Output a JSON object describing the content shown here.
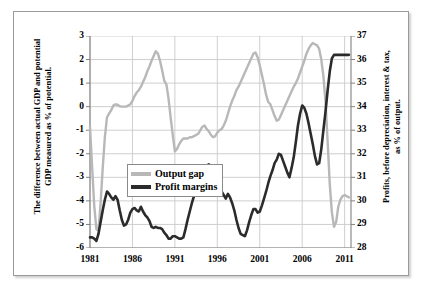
{
  "chart_data": {
    "type": "line",
    "title": "",
    "xlabel": "",
    "ylabel": "The difference between actual GDP and potential GDP measured as % of potential.",
    "ylabel_right": "Profits, before depreciation, interest & tax, as % of output.",
    "grid": true,
    "legend_position": "inside-left-middle",
    "xlim": [
      1981,
      2011.75
    ],
    "xticks": [
      "1981",
      "1986",
      "1991",
      "1996",
      "2001",
      "2006",
      "2011"
    ],
    "xtick_values": [
      1981,
      1986,
      1991,
      1996,
      2001,
      2006,
      2011
    ],
    "ylim": [
      -6,
      3
    ],
    "yticks": [
      "3",
      "2",
      "1",
      "0",
      "-1",
      "-2",
      "-3",
      "-4",
      "-5",
      "-6"
    ],
    "ytick_values": [
      3,
      2,
      1,
      0,
      -1,
      -2,
      -3,
      -4,
      -5,
      -6
    ],
    "ylim_right": [
      28,
      37
    ],
    "yticks_right": [
      "37",
      "36",
      "35",
      "34",
      "33",
      "32",
      "31",
      "30",
      "29",
      "28"
    ],
    "ytick_values_right": [
      37,
      36,
      35,
      34,
      33,
      32,
      31,
      30,
      29,
      28
    ],
    "colors": {
      "output_gap": "#b8b8b8",
      "profit_margins": "#2b2b2b",
      "grid": "#c9c9c9",
      "axis": "#808080"
    },
    "series": [
      {
        "name": "Output gap",
        "axis": "left",
        "color": "#b8b8b8",
        "x": [
          1981.0,
          1981.25,
          1981.5,
          1981.75,
          1982.0,
          1982.25,
          1982.5,
          1982.75,
          1983.0,
          1983.25,
          1983.5,
          1983.75,
          1984.0,
          1984.25,
          1984.5,
          1984.75,
          1985.0,
          1985.25,
          1985.5,
          1985.75,
          1986.0,
          1986.25,
          1986.5,
          1986.75,
          1987.0,
          1987.25,
          1987.5,
          1987.75,
          1988.0,
          1988.25,
          1988.5,
          1988.75,
          1989.0,
          1989.25,
          1989.5,
          1989.75,
          1990.0,
          1990.25,
          1990.5,
          1990.75,
          1991.0,
          1991.25,
          1991.5,
          1991.75,
          1992.0,
          1992.25,
          1992.5,
          1992.75,
          1993.0,
          1993.25,
          1993.5,
          1993.75,
          1994.0,
          1994.25,
          1994.5,
          1994.75,
          1995.0,
          1995.25,
          1995.5,
          1995.75,
          1996.0,
          1996.25,
          1996.5,
          1996.75,
          1997.0,
          1997.25,
          1997.5,
          1997.75,
          1998.0,
          1998.25,
          1998.5,
          1998.75,
          1999.0,
          1999.25,
          1999.5,
          1999.75,
          2000.0,
          2000.25,
          2000.5,
          2000.75,
          2001.0,
          2001.25,
          2001.5,
          2001.75,
          2002.0,
          2002.25,
          2002.5,
          2002.75,
          2003.0,
          2003.25,
          2003.5,
          2003.75,
          2004.0,
          2004.25,
          2004.5,
          2004.75,
          2005.0,
          2005.25,
          2005.5,
          2005.75,
          2006.0,
          2006.25,
          2006.5,
          2006.75,
          2007.0,
          2007.25,
          2007.5,
          2007.75,
          2008.0,
          2008.25,
          2008.5,
          2008.75,
          2009.0,
          2009.25,
          2009.5,
          2009.75,
          2010.0,
          2010.25,
          2010.5,
          2010.75,
          2011.0,
          2011.25,
          2011.5
        ],
        "values": [
          -0.85,
          -2.55,
          -4.2,
          -5.2,
          -5.25,
          -4.1,
          -2.6,
          -1.3,
          -0.45,
          -0.3,
          -0.15,
          0.05,
          0.1,
          0.08,
          0.02,
          0.0,
          0.0,
          0.0,
          0.05,
          0.1,
          0.25,
          0.45,
          0.6,
          0.7,
          0.85,
          1.05,
          1.25,
          1.5,
          1.7,
          1.95,
          2.15,
          2.35,
          2.25,
          1.95,
          1.55,
          1.1,
          0.95,
          0.35,
          -0.45,
          -1.2,
          -1.9,
          -1.8,
          -1.6,
          -1.45,
          -1.35,
          -1.35,
          -1.35,
          -1.3,
          -1.3,
          -1.25,
          -1.2,
          -1.15,
          -1.0,
          -0.85,
          -0.8,
          -0.95,
          -1.05,
          -1.2,
          -1.3,
          -1.25,
          -1.1,
          -1.0,
          -0.95,
          -0.8,
          -0.6,
          -0.3,
          0.0,
          0.25,
          0.45,
          0.7,
          0.85,
          1.05,
          1.25,
          1.45,
          1.65,
          1.85,
          2.05,
          2.25,
          2.3,
          2.1,
          1.75,
          1.35,
          0.95,
          0.5,
          0.2,
          0.1,
          -0.15,
          -0.4,
          -0.6,
          -0.55,
          -0.35,
          -0.15,
          0.05,
          0.25,
          0.45,
          0.65,
          0.85,
          1.0,
          1.2,
          1.45,
          1.7,
          1.95,
          2.25,
          2.45,
          2.6,
          2.7,
          2.65,
          2.6,
          2.45,
          2.0,
          1.3,
          0.2,
          -1.5,
          -3.3,
          -4.5,
          -5.1,
          -4.9,
          -4.25,
          -3.95,
          -3.8,
          -3.75,
          -3.8,
          -3.85
        ]
      },
      {
        "name": "Profit margins",
        "axis": "right",
        "color": "#2b2b2b",
        "x": [
          1981.0,
          1981.25,
          1981.5,
          1981.75,
          1982.0,
          1982.25,
          1982.5,
          1982.75,
          1983.0,
          1983.25,
          1983.5,
          1983.75,
          1984.0,
          1984.25,
          1984.5,
          1984.75,
          1985.0,
          1985.25,
          1985.5,
          1985.75,
          1986.0,
          1986.25,
          1986.5,
          1986.75,
          1987.0,
          1987.25,
          1987.5,
          1987.75,
          1988.0,
          1988.25,
          1988.5,
          1988.75,
          1989.0,
          1989.25,
          1989.5,
          1989.75,
          1990.0,
          1990.25,
          1990.5,
          1990.75,
          1991.0,
          1991.25,
          1991.5,
          1991.75,
          1992.0,
          1992.25,
          1992.5,
          1992.75,
          1993.0,
          1993.25,
          1993.5,
          1993.75,
          1994.0,
          1994.25,
          1994.5,
          1994.75,
          1995.0,
          1995.25,
          1995.5,
          1995.75,
          1996.0,
          1996.25,
          1996.5,
          1996.75,
          1997.0,
          1997.25,
          1997.5,
          1997.75,
          1998.0,
          1998.25,
          1998.5,
          1998.75,
          1999.0,
          1999.25,
          1999.5,
          1999.75,
          2000.0,
          2000.25,
          2000.5,
          2000.75,
          2001.0,
          2001.25,
          2001.5,
          2001.75,
          2002.0,
          2002.25,
          2002.5,
          2002.75,
          2003.0,
          2003.25,
          2003.5,
          2003.75,
          2004.0,
          2004.25,
          2004.5,
          2004.75,
          2005.0,
          2005.25,
          2005.5,
          2005.75,
          2006.0,
          2006.25,
          2006.5,
          2006.75,
          2007.0,
          2007.25,
          2007.5,
          2007.75,
          2008.0,
          2008.25,
          2008.5,
          2008.75,
          2009.0,
          2009.25,
          2009.5,
          2009.75,
          2010.0,
          2010.25,
          2010.5,
          2010.75,
          2011.0,
          2011.25,
          2011.5
        ],
        "values": [
          28.45,
          28.45,
          28.4,
          28.3,
          28.6,
          29.1,
          29.6,
          30.05,
          30.4,
          30.3,
          30.15,
          30.05,
          30.2,
          30.05,
          29.6,
          29.2,
          28.95,
          29.0,
          29.2,
          29.5,
          29.65,
          29.7,
          29.6,
          29.55,
          29.75,
          29.55,
          29.4,
          29.3,
          29.15,
          28.9,
          28.85,
          28.9,
          28.85,
          28.85,
          28.8,
          28.65,
          28.55,
          28.4,
          28.4,
          28.5,
          28.5,
          28.45,
          28.4,
          28.4,
          28.45,
          28.8,
          29.2,
          29.55,
          29.9,
          30.2,
          30.5,
          30.75,
          30.95,
          31.05,
          31.25,
          31.5,
          31.55,
          31.45,
          31.3,
          31.0,
          30.7,
          30.45,
          30.4,
          30.25,
          30.1,
          30.3,
          30.15,
          29.9,
          29.6,
          29.2,
          28.85,
          28.6,
          28.55,
          28.5,
          28.75,
          29.1,
          29.4,
          29.65,
          29.65,
          29.5,
          29.55,
          29.8,
          30.1,
          30.4,
          30.75,
          31.05,
          31.3,
          31.6,
          31.75,
          32.0,
          31.95,
          31.7,
          31.45,
          31.2,
          31.0,
          31.4,
          31.85,
          32.5,
          33.2,
          33.7,
          34.05,
          33.95,
          33.7,
          33.3,
          32.85,
          32.4,
          31.9,
          31.55,
          31.6,
          32.2,
          33.0,
          33.8,
          34.7,
          35.5,
          36.05,
          36.2,
          36.2,
          36.2,
          36.2,
          36.2,
          36.2,
          36.2,
          36.2
        ]
      }
    ]
  },
  "axis_titles": {
    "left_line1": "The difference between actual GDP and potential",
    "left_line2": "GDP measured as % of potential.",
    "right_line1": "Profits, before depreciation, interest & tax,",
    "right_line2": "as % of output."
  },
  "legend": {
    "items": [
      {
        "label": "Output gap",
        "color": "#b8b8b8"
      },
      {
        "label": "Profit margins",
        "color": "#2b2b2b"
      }
    ]
  }
}
